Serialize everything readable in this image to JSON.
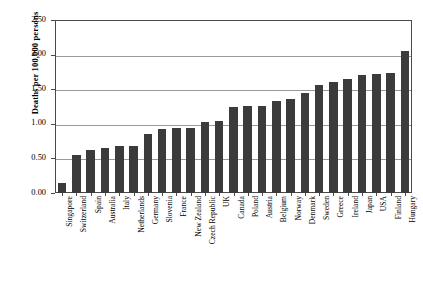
{
  "chart_data": {
    "type": "bar",
    "title": "",
    "xlabel": "",
    "ylabel": "Deaths per 100,000 persons",
    "ylim": [
      0.0,
      2.5
    ],
    "ytick_labels": [
      "0.00",
      "0.50",
      "1.00",
      "1.50",
      "2.00",
      "2.50"
    ],
    "ytick_values": [
      0.0,
      0.5,
      1.0,
      1.5,
      2.0,
      2.5
    ],
    "grid": true,
    "legend": "none",
    "bar_color": "#3b3b3b",
    "categories": [
      "Singapore",
      "Switzerland",
      "Spain",
      "Australia",
      "Italy",
      "Netherlands",
      "Germany",
      "Slovenia",
      "France",
      "New Zealand",
      "Czech Republic",
      "UK",
      "Canada",
      "Poland",
      "Austria",
      "Belgium",
      "Norway",
      "Denmark",
      "Sweden",
      "Greece",
      "Ireland",
      "Japan",
      "USA",
      "Finland",
      "Hungary"
    ],
    "values": [
      0.14,
      0.55,
      0.62,
      0.65,
      0.68,
      0.68,
      0.86,
      0.93,
      0.94,
      0.94,
      1.03,
      1.04,
      1.24,
      1.26,
      1.26,
      1.33,
      1.36,
      1.44,
      1.56,
      1.6,
      1.65,
      1.7,
      1.72,
      1.73,
      2.05
    ]
  }
}
